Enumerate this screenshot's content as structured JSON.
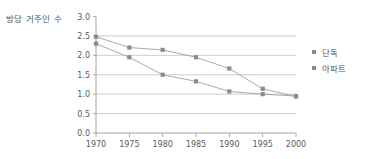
{
  "chart_data": {
    "type": "line",
    "title": "",
    "xlabel": "",
    "ylabel": "방당 거주인 수",
    "x": [
      1970,
      1975,
      1980,
      1985,
      1990,
      1995,
      2000
    ],
    "xtick_labels": [
      "1970",
      "1975",
      "1980",
      "1985",
      "1990",
      "1995",
      "2000"
    ],
    "ytick_labels": [
      "0.0",
      "0.5",
      "1.0",
      "1.5",
      "2.0",
      "2.5",
      "3.0"
    ],
    "ytick_values": [
      0.0,
      0.5,
      1.0,
      1.5,
      2.0,
      2.5,
      3.0
    ],
    "ylim": [
      0.0,
      3.0
    ],
    "xlim": [
      1970,
      2000
    ],
    "grid": true,
    "legend_position": "right",
    "series": [
      {
        "name": "단독",
        "color": "#8c8c8c",
        "values": [
          2.48,
          2.2,
          2.14,
          1.95,
          1.66,
          1.14,
          0.94
        ]
      },
      {
        "name": "아파트",
        "color": "#8c8c8c",
        "values": [
          2.3,
          1.95,
          1.5,
          1.33,
          1.07,
          1.0,
          0.95
        ]
      }
    ]
  },
  "legend": {
    "items": [
      {
        "label": "단독"
      },
      {
        "label": "아파트"
      }
    ]
  }
}
